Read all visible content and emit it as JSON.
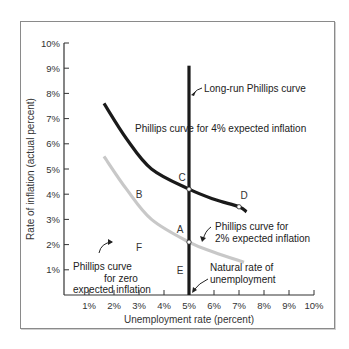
{
  "chart_data": {
    "type": "line",
    "title": "",
    "xlabel": "Unemployment rate (percent)",
    "ylabel": "Rate of inflation (actual percent)",
    "xlim": [
      0,
      10
    ],
    "ylim": [
      0,
      10
    ],
    "grid": false,
    "x_ticks": [
      "1%",
      "2%",
      "3%",
      "4%",
      "5%",
      "6%",
      "7%",
      "8%",
      "9%",
      "10%"
    ],
    "y_ticks": [
      "1%",
      "2%",
      "3%",
      "4%",
      "5%",
      "6%",
      "7%",
      "8%",
      "9%",
      "10%"
    ],
    "series": [
      {
        "name": "Phillips curve for 4% expected inflation",
        "color": "#1a1a1a",
        "points": [
          [
            1.6,
            7.6
          ],
          [
            2.5,
            6.2
          ],
          [
            3.5,
            5.0
          ],
          [
            5.0,
            4.2
          ],
          [
            6.0,
            3.8
          ],
          [
            7.0,
            3.5
          ],
          [
            7.3,
            3.3
          ]
        ]
      },
      {
        "name": "Phillips curve for 2% expected inflation",
        "color": "#c8c8c8",
        "points": [
          [
            1.6,
            5.5
          ],
          [
            2.5,
            4.2
          ],
          [
            3.5,
            3.0
          ],
          [
            5.0,
            2.1
          ],
          [
            6.0,
            1.7
          ],
          [
            7.2,
            1.3
          ]
        ]
      },
      {
        "name": "Long-run Phillips curve",
        "color": "#1a1a1a",
        "points": [
          [
            5.0,
            9.1
          ],
          [
            5.0,
            0
          ]
        ]
      }
    ],
    "points": [
      {
        "label": "C",
        "x": 5.0,
        "y": 4.2,
        "marker": true
      },
      {
        "label": "D",
        "x": 7.0,
        "y": 3.5,
        "marker": true
      },
      {
        "label": "A",
        "x": 5.0,
        "y": 2.1,
        "marker": true
      },
      {
        "label": "B",
        "x": 3.0,
        "y": 4.0,
        "marker": false
      },
      {
        "label": "E",
        "x": 5.0,
        "y": 1.0,
        "marker": false
      },
      {
        "label": "F",
        "x": 3.0,
        "y": 1.9,
        "marker": false
      }
    ],
    "annotations": [
      {
        "id": "lrpc",
        "text": [
          "Long-run Phillips curve"
        ]
      },
      {
        "id": "pc4",
        "text": [
          "Phillips curve for 4% expected inflation"
        ]
      },
      {
        "id": "pc2",
        "text": [
          "Phillips curve for",
          "2% expected inflation"
        ]
      },
      {
        "id": "pc0",
        "text": [
          "Phillips curve",
          "for zero",
          "expected inflation"
        ]
      },
      {
        "id": "nru",
        "text": [
          "Natural rate of",
          "unemployment"
        ]
      }
    ]
  }
}
